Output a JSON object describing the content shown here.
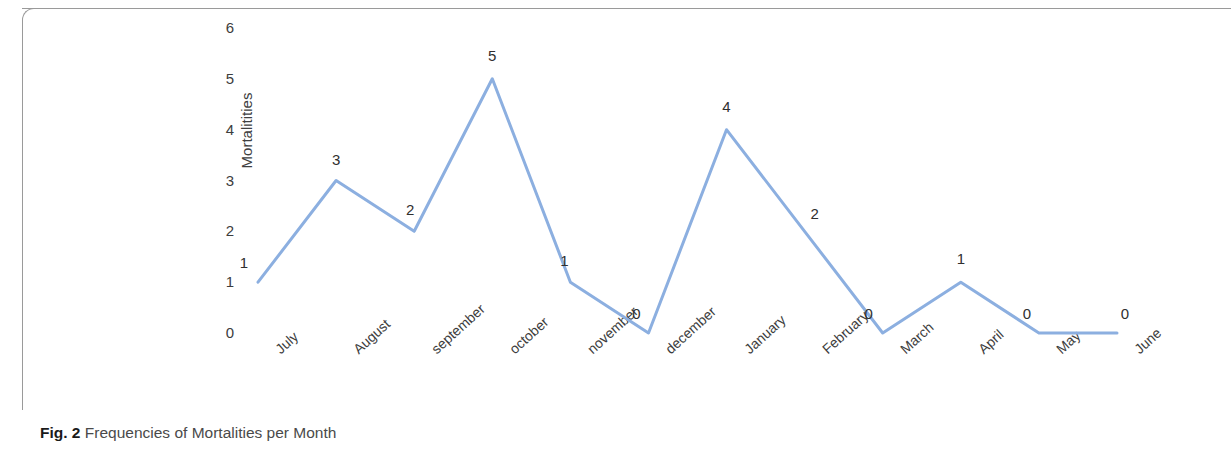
{
  "figure": {
    "caption_label": "Fig. 2",
    "caption_text": "Frequencies of Mortalities per Month"
  },
  "chart_data": {
    "type": "line",
    "title": "",
    "subtitle": "",
    "xlabel": "",
    "ylabel": "Mortalitities",
    "categories": [
      "July",
      "August",
      "september",
      "october",
      "november",
      "december",
      "January",
      "February",
      "March",
      "April",
      "May",
      "June"
    ],
    "values": [
      1,
      3,
      2,
      5,
      1,
      0,
      4,
      2,
      0,
      1,
      0,
      0
    ],
    "data_labels": [
      "1",
      "3",
      "2",
      "5",
      "1",
      "0",
      "4",
      "2",
      "0",
      "1",
      "0",
      "0"
    ],
    "ylim": [
      0,
      6
    ],
    "yticks": [
      "0",
      "1",
      "2",
      "3",
      "4",
      "5",
      "6"
    ],
    "grid": false,
    "legend": false,
    "legend_position": "none",
    "markers": false,
    "line_color": "#8CAFE0",
    "line_width": 3,
    "xtick_rotation": -42,
    "axis_text_color": "#3d3d3d"
  }
}
